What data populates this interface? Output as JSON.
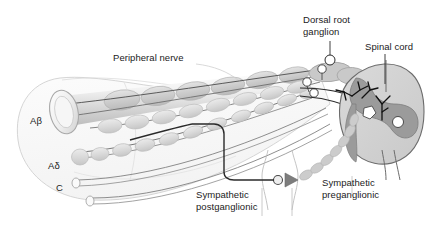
{
  "figure": {
    "background_color": "#ffffff",
    "width": 426,
    "height": 235
  },
  "labels": {
    "peripheral_nerve": "Peripheral nerve",
    "dorsal_root_ganglion": "Dorsal root\nganglion",
    "spinal_cord": "Spinal cord",
    "sympathetic_preganglionic": "Sympathetic\npreganglionic",
    "sympathetic_postganglionic": "Sympathetic\npostganglionic"
  },
  "fiber_labels": {
    "a_beta": "Aβ",
    "a_delta": "Aδ",
    "c": "C"
  },
  "fibers": [
    {
      "name": "a-beta-fiber",
      "label": "Aβ",
      "type": "large myelinated",
      "myelinated": true,
      "description": "Large-diameter myelinated sensory fiber with cut cylindrical end"
    },
    {
      "name": "a-delta-fiber",
      "label": "Aδ",
      "type": "small myelinated",
      "myelinated": true,
      "description": "Thin myelinated sensory fiber"
    },
    {
      "name": "c-fiber",
      "label": "C",
      "type": "unmyelinated",
      "myelinated": false,
      "description": "Unmyelinated slow-conducting sensory fiber"
    }
  ],
  "structures": [
    {
      "name": "epineurium-sheath",
      "label": "Peripheral nerve"
    },
    {
      "name": "dorsal-root-ganglion",
      "label": "Dorsal root ganglion"
    },
    {
      "name": "spinal-cord",
      "label": "Spinal cord"
    },
    {
      "name": "sympathetic-ganglion",
      "label": "Sympathetic ganglion"
    },
    {
      "name": "sympathetic-preganglionic-fiber",
      "label": "Sympathetic preganglionic"
    },
    {
      "name": "sympathetic-postganglionic-fiber",
      "label": "Sympathetic postganglionic"
    }
  ],
  "colors": {
    "background": "#ffffff",
    "text": "#1b1b1b",
    "outline": "#8a8a8a",
    "myelin_fill": "#cfcfcf",
    "myelin_fill_light": "#dcdcdc",
    "axon_line": "#4a4a4a",
    "fiber_line_dark": "#3a3a3a",
    "gray_matter": "#9a9a9a",
    "white_matter": "#d2d2d2",
    "neuron_body": "#ffffff",
    "dendrite": "#111111",
    "sheath_fill": "#fbfbfb",
    "sheath_stroke": "#cccccc",
    "ganglion_fill": "#c6c6c6",
    "synapse_arrow": "#666666"
  }
}
